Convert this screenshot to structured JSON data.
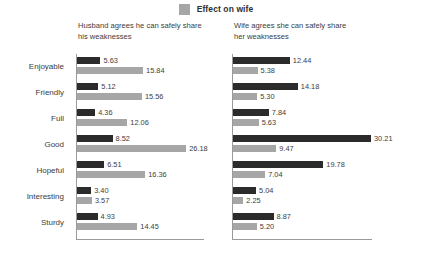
{
  "legend": {
    "items": [
      {
        "label": "Effect on wife",
        "color": "#a6a6a6",
        "icon": "legend-swatch-icon"
      }
    ]
  },
  "panels": {
    "left": {
      "title_line1": "Husband agrees he can safely share",
      "title_line2": "his weaknesses"
    },
    "right": {
      "title_line1": "Wife agrees she can safely share",
      "title_line2": "her weaknesses"
    }
  },
  "chart_data": {
    "type": "bar",
    "orientation": "horizontal",
    "title": "",
    "subtitle": "",
    "xlabel": "",
    "ylabel": "",
    "grid": false,
    "legend_position": "top-center",
    "colors": {
      "series1": "#2b2b2b",
      "series2": "#a6a6a6",
      "axis": "#9a9a9a",
      "text": "#3c3c3c"
    },
    "categories": [
      "Enjoyable",
      "Friendly",
      "Full",
      "Good",
      "Hopeful",
      "Interesting",
      "Sturdy"
    ],
    "panels": [
      {
        "name": "Husband agrees he can safely share his weaknesses",
        "xlim": [
          0,
          30.21
        ],
        "series": [
          {
            "name": "series-dark",
            "values": [
              5.63,
              5.12,
              4.36,
              8.52,
              6.51,
              3.4,
              4.93
            ]
          },
          {
            "name": "Effect on wife",
            "values": [
              15.84,
              15.56,
              12.06,
              26.18,
              16.36,
              3.57,
              14.45
            ]
          }
        ]
      },
      {
        "name": "Wife agrees she can safely share her weaknesses",
        "xlim": [
          0,
          30.21
        ],
        "series": [
          {
            "name": "series-dark",
            "values": [
              12.44,
              14.18,
              7.84,
              30.21,
              19.78,
              5.04,
              8.87
            ]
          },
          {
            "name": "Effect on wife",
            "values": [
              5.38,
              5.3,
              5.63,
              9.47,
              7.04,
              2.25,
              5.2
            ]
          }
        ]
      }
    ],
    "labels": {
      "left": {
        "dark": [
          "5.63",
          "5.12",
          "4.36",
          "8.52",
          "6.51",
          "3.40",
          "4.93"
        ],
        "gray": [
          "15.84",
          "15.56",
          "12.06",
          "26.18",
          "16.36",
          "3.57",
          "14.45"
        ]
      },
      "right": {
        "dark": [
          "12.44",
          "14.18",
          "7.84",
          "30.21",
          "19.78",
          "5.04",
          "8.87"
        ],
        "gray": [
          "5.38",
          "5.30",
          "5.63",
          "9.47",
          "7.04",
          "2.25",
          "5.20"
        ]
      }
    }
  }
}
